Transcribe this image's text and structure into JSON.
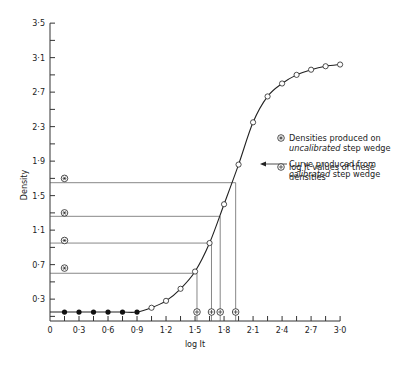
{
  "chart_data": {
    "type": "line",
    "title": "",
    "xlabel": "log It",
    "ylabel": "Density",
    "xlim": [
      0,
      3.0
    ],
    "ylim": [
      0,
      3.5
    ],
    "grid": false,
    "x_ticks": [
      "0",
      "0·3",
      "0·6",
      "0·9",
      "1·2",
      "1·5",
      "1·8",
      "2·1",
      "2·4",
      "2·7",
      "3·0"
    ],
    "x_tick_values": [
      0,
      0.3,
      0.6,
      0.9,
      1.2,
      1.5,
      1.8,
      2.1,
      2.4,
      2.7,
      3.0
    ],
    "y_ticks": [
      "0·3",
      "0·7",
      "1·1",
      "1·5",
      "1·9",
      "2·3",
      "2·7",
      "3·1",
      "3·5"
    ],
    "y_tick_values": [
      0.3,
      0.7,
      1.1,
      1.5,
      1.9,
      2.3,
      2.7,
      3.1,
      3.5
    ],
    "series": [
      {
        "name": "Curve produced from calibrated step wedge",
        "marker": "open-circle",
        "x": [
          0.9,
          1.05,
          1.2,
          1.35,
          1.5,
          1.65,
          1.8,
          1.95,
          2.1,
          2.25,
          2.4,
          2.55,
          2.7,
          2.85,
          3.0
        ],
        "y": [
          0.15,
          0.2,
          0.28,
          0.42,
          0.62,
          0.95,
          1.4,
          1.86,
          2.35,
          2.65,
          2.8,
          2.9,
          2.96,
          3.0,
          3.02
        ]
      },
      {
        "name": "Base density (filled points)",
        "marker": "filled-circle",
        "x": [
          0.15,
          0.3,
          0.45,
          0.6,
          0.75,
          0.9
        ],
        "y": [
          0.15,
          0.15,
          0.15,
          0.15,
          0.15,
          0.15
        ]
      },
      {
        "name": "Densities produced on uncalibrated step wedge",
        "marker": "circled-asterisk",
        "x": [
          0.15,
          0.15,
          0.15,
          0.15
        ],
        "y": [
          0.66,
          0.98,
          1.3,
          1.7
        ]
      },
      {
        "name": "log It values of these densities",
        "marker": "circled-plus",
        "x": [
          1.52,
          1.67,
          1.76,
          1.92
        ],
        "y": [
          0.07,
          0.07,
          0.07,
          0.07
        ]
      }
    ],
    "projection_lines": [
      {
        "density": 0.6,
        "log_it": 1.52
      },
      {
        "density": 0.95,
        "log_it": 1.67
      },
      {
        "density": 1.26,
        "log_it": 1.76
      },
      {
        "density": 1.65,
        "log_it": 1.92
      }
    ],
    "annotations": [
      {
        "text": "Curve produced from",
        "text2": "calibrated",
        "text3": " step wedge",
        "arrow_to": [
          1.97,
          1.92
        ]
      }
    ],
    "legend": [
      {
        "symbol": "circled-asterisk",
        "line1": "Densities produced on",
        "line2_italic": "uncalibrated",
        "line2_rest": " step wedge"
      },
      {
        "symbol": "circled-plus",
        "line1": "log It values of these",
        "line2": "densities"
      }
    ],
    "legend_position": "right-middle"
  }
}
